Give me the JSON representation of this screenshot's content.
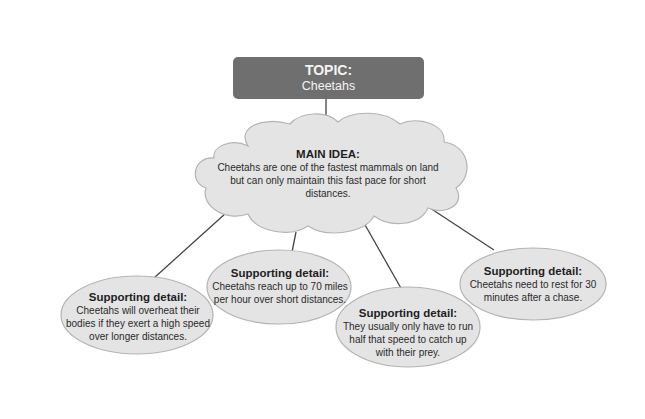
{
  "topic": {
    "label": "TOPIC:",
    "value": "Cheetahs"
  },
  "main_idea": {
    "label": "MAIN IDEA:",
    "text": "Cheetahs are one of the fastest mammals on land but can only maintain this fast pace for short distances."
  },
  "supporting_details": [
    {
      "label": "Supporting detail:",
      "text": "Cheetahs will overheat their bodies if they exert a high speed over longer distances."
    },
    {
      "label": "Supporting detail:",
      "text": "Cheetahs reach up to 70 miles per hour over short distances."
    },
    {
      "label": "Supporting detail:",
      "text": "They usually only have to run half that speed to catch up with their prey."
    },
    {
      "label": "Supporting detail:",
      "text": "Cheetahs need to rest for 30 minutes after a chase."
    }
  ],
  "colors": {
    "topic_fill": "#6f6f6f",
    "topic_text": "#f4f4f4",
    "bubble_fill": "#e4e4e4",
    "bubble_stroke": "#b4b4b4",
    "connector": "#444444",
    "text": "#2a2a2a"
  }
}
